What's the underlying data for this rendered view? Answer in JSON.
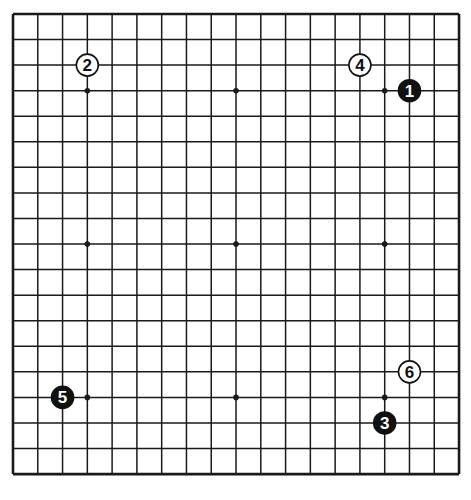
{
  "diagram": {
    "type": "go-board",
    "size": 19,
    "origin_px": [
      13,
      14
    ],
    "spacing_px": [
      24.78,
      25.56
    ],
    "colors": {
      "line": "#1a1a1a",
      "black_stone": "#111111",
      "white_stone": "#ffffff",
      "background": "#ffffff"
    },
    "star_points": [
      [
        3,
        3
      ],
      [
        9,
        3
      ],
      [
        15,
        3
      ],
      [
        3,
        9
      ],
      [
        9,
        9
      ],
      [
        15,
        9
      ],
      [
        3,
        15
      ],
      [
        9,
        15
      ],
      [
        15,
        15
      ]
    ],
    "stones": [
      {
        "move": "1",
        "color": "black",
        "col": 16,
        "row": 3
      },
      {
        "move": "2",
        "color": "white",
        "col": 3,
        "row": 2
      },
      {
        "move": "3",
        "color": "black",
        "col": 15,
        "row": 16
      },
      {
        "move": "4",
        "color": "white",
        "col": 14,
        "row": 2
      },
      {
        "move": "5",
        "color": "black",
        "col": 2,
        "row": 15
      },
      {
        "move": "6",
        "color": "white",
        "col": 16,
        "row": 14
      }
    ]
  }
}
